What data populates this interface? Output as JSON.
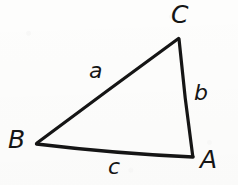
{
  "figure": {
    "kind": "geometry-diagram",
    "background_color": "#fdfdfc",
    "ink_color": "#151515",
    "stroke_width": 3,
    "vertices": [
      {
        "id": "A",
        "label": "A",
        "x": 193,
        "y": 157,
        "label_x": 200,
        "label_y": 147
      },
      {
        "id": "B",
        "label": "B",
        "x": 36,
        "y": 144,
        "label_x": 8,
        "label_y": 127
      },
      {
        "id": "C",
        "label": "C",
        "x": 179,
        "y": 38,
        "label_x": 171,
        "label_y": 2
      }
    ],
    "sides": [
      {
        "id": "a",
        "label": "a",
        "from": "B",
        "to": "C",
        "label_x": 89,
        "label_y": 60
      },
      {
        "id": "b",
        "label": "b",
        "from": "C",
        "to": "A",
        "label_x": 194,
        "label_y": 82
      },
      {
        "id": "c",
        "label": "c",
        "from": "B",
        "to": "A",
        "label_x": 108,
        "label_y": 156
      }
    ],
    "path": "M 36 144 L 179 38 L 193 157 Z"
  }
}
